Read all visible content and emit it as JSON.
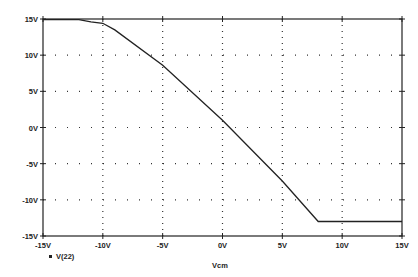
{
  "chart_data": {
    "type": "line",
    "title": "",
    "xlabel": "Vcm",
    "ylabel": "",
    "xlim": [
      -15,
      15
    ],
    "ylim": [
      -15,
      15
    ],
    "grid": "dotted",
    "legend": [
      "V(22)"
    ],
    "legend_position": "bottom-left",
    "x_ticks": [
      -15,
      -10,
      -5,
      0,
      5,
      10,
      15
    ],
    "x_tick_labels": [
      "-15V",
      "-10V",
      "-5V",
      "0V",
      "5V",
      "10V",
      "15V"
    ],
    "y_ticks": [
      15,
      10,
      5,
      0,
      -5,
      -10,
      -15
    ],
    "y_tick_labels": [
      "15V",
      "10V",
      "5V",
      "0V",
      "-5V",
      "-10V",
      "-15V"
    ],
    "series": [
      {
        "name": "V(22)",
        "x": [
          -15,
          -12,
          -11,
          -10,
          -9,
          -5,
          0,
          5,
          8,
          10,
          15
        ],
        "y": [
          14.9,
          14.9,
          14.6,
          14.4,
          13.5,
          8.6,
          1.0,
          -7.4,
          -13.0,
          -13.0,
          -13.0
        ]
      }
    ]
  }
}
